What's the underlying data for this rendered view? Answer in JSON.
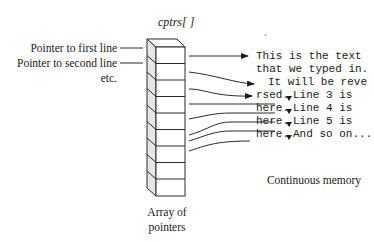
{
  "diagram": {
    "title": "cptrs[ ]",
    "left_labels": [
      "Pointer to first line",
      "Pointer to second line",
      "etc."
    ],
    "array_caption": [
      "Array of",
      "pointers"
    ],
    "memory_caption": "Continuous memory",
    "memory_lines": [
      "This is the text",
      "that we typed in.",
      "It will be reve",
      "rsed.",
      "Line 3 is",
      "here.",
      "Line 4 is",
      "here.",
      "Line 5 is",
      "here.",
      "And so on..."
    ],
    "array_cells": 9,
    "stray_mark": "`",
    "colors": {
      "line": "#2a2a2a",
      "side_fill": "#e6e6e6",
      "text": "#1a1a1a"
    }
  }
}
